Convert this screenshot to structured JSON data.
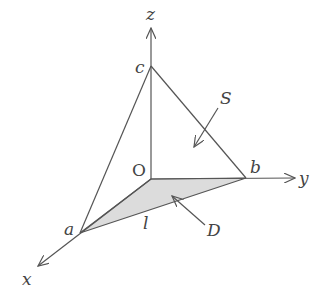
{
  "diagram": {
    "axes": {
      "x": {
        "label": "x"
      },
      "y": {
        "label": "y"
      },
      "z": {
        "label": "z"
      }
    },
    "points": {
      "origin": {
        "label": "O"
      },
      "a": {
        "label": "a"
      },
      "b": {
        "label": "b"
      },
      "c": {
        "label": "c"
      }
    },
    "edge_labels": {
      "ab": {
        "label": "l"
      }
    },
    "annotations": {
      "surface": {
        "label": "S"
      },
      "region": {
        "label": "D"
      }
    },
    "colors": {
      "stroke": "#555555",
      "region_fill": "#dcdcdc",
      "text": "#444444"
    }
  }
}
